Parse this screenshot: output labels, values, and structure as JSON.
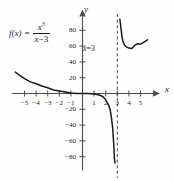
{
  "figure": {
    "function_label": {
      "name": "f(x)",
      "equals": "=",
      "numerator_base": "x",
      "numerator_exponent": "3",
      "denominator_var": "x",
      "denominator_op": "−",
      "denominator_const": "3"
    },
    "axis_labels": {
      "x": "x",
      "y": "y"
    },
    "asymptote_annotation": {
      "var": "x",
      "equals": "=",
      "value": "3"
    },
    "colors": {
      "curve": "#1a1a1a",
      "axis": "#4d4d4d",
      "asymptote": "#333333",
      "background": "#fefefe"
    }
  },
  "chart_data": {
    "type": "line",
    "title": "",
    "xlabel": "x",
    "ylabel": "y",
    "xlim": [
      -5.9,
      5.9
    ],
    "ylim": [
      -95,
      95
    ],
    "grid": false,
    "legend": null,
    "xticks": [
      -5,
      -4,
      -3,
      -2,
      -1,
      1,
      2,
      3,
      4,
      5
    ],
    "xtick_labels": [
      "−5",
      "−4",
      "−3",
      "−2",
      "−1",
      "1",
      "2",
      "3",
      "4",
      "5"
    ],
    "yticks": [
      -80,
      -60,
      -40,
      -20,
      20,
      40,
      60,
      80
    ],
    "ytick_labels": [
      "−80",
      "−60",
      "−40",
      "−20",
      "20",
      "40",
      "60",
      "80"
    ],
    "annotations": [
      {
        "text": "f(x) = x³/(x − 3)",
        "x": -4.6,
        "y": 72
      },
      {
        "text": "x = 3",
        "x": 1.35,
        "y": 58
      }
    ],
    "asymptotes": [
      {
        "type": "vertical",
        "x": 3,
        "style": "dashed",
        "label": "x = 3"
      }
    ],
    "series": [
      {
        "name": "f(x) = x^3/(x-3)",
        "branch": "left",
        "points": [
          [
            -5.8,
            27.2
          ],
          [
            -5.5,
            23.8
          ],
          [
            -5.0,
            18.8
          ],
          [
            -4.5,
            14.7
          ],
          [
            -4.0,
            12.3
          ],
          [
            -3.5,
            9.4
          ],
          [
            -3.0,
            7.3
          ],
          [
            -2.5,
            4.5
          ],
          [
            -2.0,
            3.2
          ],
          [
            -1.5,
            1.9
          ],
          [
            -1.0,
            0.75
          ],
          [
            -0.5,
            0.04
          ],
          [
            0.0,
            0.0
          ],
          [
            0.5,
            -0.05
          ],
          [
            1.0,
            -0.5
          ],
          [
            1.5,
            -2.25
          ],
          [
            1.75,
            -3.8
          ],
          [
            2.0,
            -8.0
          ],
          [
            2.25,
            -14.6
          ],
          [
            2.4,
            -21.6
          ],
          [
            2.5,
            -31.25
          ],
          [
            2.6,
            -43.9
          ],
          [
            2.7,
            -65.6
          ],
          [
            2.75,
            -82.7
          ],
          [
            2.8,
            -87.9
          ]
        ]
      },
      {
        "name": "f(x) = x^3/(x-3)",
        "branch": "right",
        "points": [
          [
            3.22,
            94.0
          ],
          [
            3.3,
            85.0
          ],
          [
            3.4,
            72.0
          ],
          [
            3.5,
            65.3
          ],
          [
            3.6,
            62.0
          ],
          [
            3.75,
            59.3
          ],
          [
            4.0,
            57.5
          ],
          [
            4.25,
            57.0
          ],
          [
            4.5,
            60.8
          ],
          [
            4.75,
            63.0
          ],
          [
            5.0,
            62.5
          ],
          [
            5.3,
            65.0
          ],
          [
            5.6,
            68.0
          ]
        ]
      }
    ]
  }
}
